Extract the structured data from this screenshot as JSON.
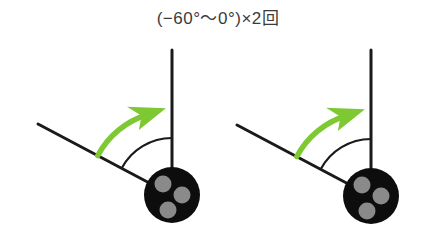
{
  "title": {
    "text": "(−60°〜0°)×2回",
    "color": "#3b3b3b"
  },
  "colors": {
    "line": "#1a1a1a",
    "arrow_green": "#7ec832",
    "ball_fill": "#0d0d0d",
    "dot_fill": "#8a8a8a",
    "background": "#ffffff"
  },
  "diagrams": [
    {
      "name": "pendulum-diagram-left",
      "label": "pendulum swing diagram 1",
      "pivot": {
        "x": 172,
        "y": 195
      },
      "ball": {
        "cx": 172,
        "cy": 195,
        "r": 28
      },
      "dots": [
        {
          "cx": 163,
          "cy": 184,
          "r": 8.5
        },
        {
          "cx": 182,
          "cy": 195,
          "r": 8.5
        },
        {
          "cx": 168,
          "cy": 210,
          "r": 8.5
        },
        {
          "cx": 0,
          "cy": 0,
          "r": 0
        }
      ],
      "vertical_line": {
        "x1": 172,
        "y1": 50,
        "x2": 172,
        "y2": 195
      },
      "diagonal_line": {
        "x1": 38,
        "y1": 124,
        "x2": 172,
        "y2": 195,
        "angle_deg": -62
      },
      "arc": {
        "radius": 57,
        "from_deg": -62,
        "to_deg": 0
      },
      "green_arrow": {
        "radius": 84,
        "from_deg": -62,
        "to_deg": -4
      }
    },
    {
      "name": "pendulum-diagram-right",
      "label": "pendulum swing diagram 2",
      "pivot": {
        "x": 172,
        "y": 196
      },
      "ball": {
        "cx": 172,
        "cy": 196,
        "r": 28
      },
      "dots": [
        {
          "cx": 163,
          "cy": 185,
          "r": 8.5
        },
        {
          "cx": 182,
          "cy": 196,
          "r": 8.5
        },
        {
          "cx": 168,
          "cy": 211,
          "r": 8.5
        },
        {
          "cx": 0,
          "cy": 0,
          "r": 0
        }
      ],
      "vertical_line": {
        "x1": 172,
        "y1": 50,
        "x2": 172,
        "y2": 196
      },
      "diagonal_line": {
        "x1": 38,
        "y1": 125,
        "x2": 172,
        "y2": 196,
        "angle_deg": -62
      },
      "arc": {
        "radius": 57,
        "from_deg": -62,
        "to_deg": 0
      },
      "green_arrow": {
        "radius": 84,
        "from_deg": -62,
        "to_deg": -4
      }
    }
  ]
}
